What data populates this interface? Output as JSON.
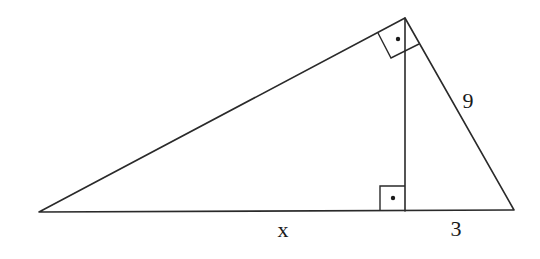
{
  "diagram": {
    "type": "right-triangle-with-altitude",
    "vertices": {
      "left": [
        39,
        212
      ],
      "apex": [
        405,
        18
      ],
      "right": [
        514,
        210
      ],
      "altitude_foot": [
        405,
        211
      ]
    },
    "labels": {
      "hypotenuse_left_segment": "x",
      "hypotenuse_right_segment": "3",
      "right_leg": "9"
    },
    "right_angle_marks": [
      {
        "at": "apex",
        "dot": true
      },
      {
        "at": "altitude_foot",
        "dot": true
      }
    ],
    "stroke_color": "#2a2a2a",
    "background_color": "#ffffff"
  }
}
